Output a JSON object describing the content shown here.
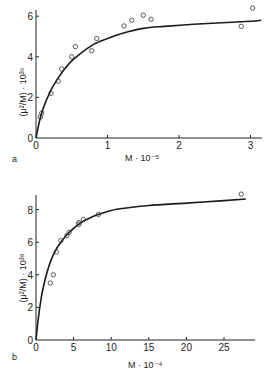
{
  "chart_data": [
    {
      "panel": "a",
      "type": "scatter",
      "title": "",
      "xlabel": "M · 10⁻⁵",
      "ylabel": "(μ²/M) · 10³⁶",
      "xlim": [
        0,
        3.15
      ],
      "ylim": [
        0,
        6.3
      ],
      "xticks": [
        0,
        1,
        2,
        3
      ],
      "yticks": [
        0,
        2,
        4,
        6
      ],
      "grid": false,
      "legend": null,
      "series": [
        {
          "name": "measured",
          "style": "open-circle",
          "x": [
            0.06,
            0.08,
            0.21,
            0.31,
            0.36,
            0.5,
            0.55,
            0.78,
            0.85,
            1.23,
            1.34,
            1.5,
            1.61,
            2.87,
            3.03
          ],
          "y": [
            1.03,
            1.23,
            2.2,
            2.8,
            3.4,
            4.0,
            4.5,
            4.3,
            4.9,
            5.52,
            5.8,
            6.05,
            5.85,
            5.5,
            6.4
          ]
        },
        {
          "name": "fitted curve",
          "style": "line",
          "x": [
            0,
            0.05,
            0.1,
            0.2,
            0.3,
            0.4,
            0.5,
            0.6,
            0.8,
            1.0,
            1.2,
            1.5,
            1.8,
            2.2,
            2.6,
            3.0,
            3.15
          ],
          "y": [
            0,
            0.85,
            1.45,
            2.3,
            2.9,
            3.4,
            3.8,
            4.1,
            4.6,
            4.9,
            5.15,
            5.4,
            5.5,
            5.6,
            5.68,
            5.75,
            5.8
          ]
        }
      ]
    },
    {
      "panel": "b",
      "type": "scatter",
      "title": "",
      "xlabel": "M · 10⁻⁴",
      "ylabel": "(μ²/M) · 10³⁸",
      "xlim": [
        0,
        28
      ],
      "ylim": [
        0,
        9
      ],
      "xticks": [
        0,
        5,
        10,
        15,
        20,
        25
      ],
      "yticks": [
        0,
        2,
        4,
        6,
        8
      ],
      "grid": false,
      "legend": null,
      "series": [
        {
          "name": "measured",
          "style": "open-circle",
          "x": [
            1.9,
            2.3,
            2.7,
            3.3,
            4.1,
            4.4,
            5.7,
            5.7,
            6.3,
            8.3,
            27.3
          ],
          "y": [
            3.5,
            4.0,
            5.4,
            6.1,
            6.4,
            6.6,
            7.1,
            7.2,
            7.4,
            7.7,
            8.95
          ]
        },
        {
          "name": "fitted curve",
          "style": "line",
          "x": [
            0,
            0.3,
            0.7,
            1.0,
            1.5,
            2.0,
            2.5,
            3.0,
            4.0,
            5.0,
            6.0,
            7.0,
            8.0,
            10.0,
            12.0,
            15.0,
            20.0,
            25.0,
            27.9
          ],
          "y": [
            0,
            1.3,
            2.6,
            3.3,
            4.2,
            4.9,
            5.4,
            5.8,
            6.4,
            6.85,
            7.2,
            7.45,
            7.65,
            7.95,
            8.1,
            8.25,
            8.4,
            8.55,
            8.65
          ]
        }
      ]
    }
  ],
  "panels": {
    "a": {
      "label": "a",
      "xlabel": "M · 10⁻⁵",
      "ylabel": "(μ²/M) · 10³⁶",
      "xticks": [
        "0",
        "1",
        "2",
        "3"
      ],
      "yticks": [
        "0",
        "2",
        "4",
        "6"
      ]
    },
    "b": {
      "label": "b",
      "xlabel": "M · 10⁻⁴",
      "ylabel": "(μ²/M) · 10³⁸",
      "xticks": [
        "0",
        "5",
        "10",
        "15",
        "20",
        "25"
      ],
      "yticks": [
        "0",
        "2",
        "4",
        "6",
        "8"
      ]
    }
  }
}
